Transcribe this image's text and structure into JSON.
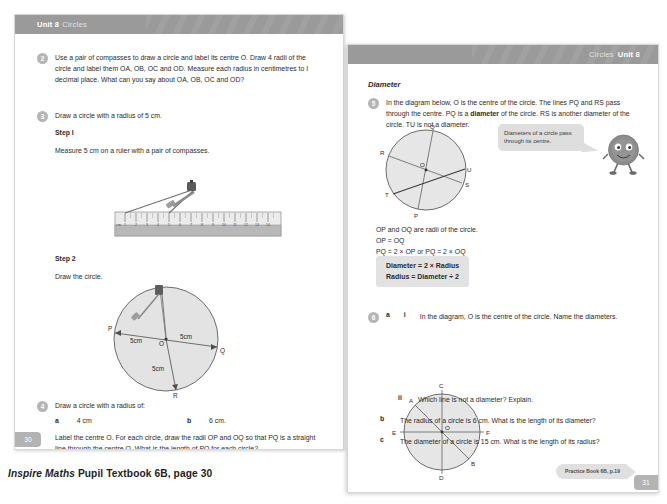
{
  "caption": {
    "italic_part": "Inspire Maths",
    "rest_part": " Pupil Textbook 6B, page 30"
  },
  "left_page": {
    "header": {
      "unit": "Unit 8",
      "topic": "Circles"
    },
    "page_number": "30",
    "questions": [
      {
        "number": "2",
        "text": "Use a pair of compasses to draw a circle and label its centre O. Draw 4 radii of the circle and label them OA, OB, OC and OD. Measure each radius in centimetres to I decimal place. What can you say about OA, OB, OC and OD?"
      },
      {
        "number": "3",
        "text": "Draw a circle with a radius of 5 cm."
      },
      {
        "number": "4",
        "text": "Draw a circle with a radius of:"
      }
    ],
    "step1": {
      "label": "Step I",
      "text": "Measure 5 cm on a ruler with a pair of compasses."
    },
    "step2": {
      "label": "Step 2",
      "text": "Draw the circle."
    },
    "q4_options": {
      "a_letter": "a",
      "a_value": "4 cm",
      "b_letter": "b",
      "b_value": "6 cm."
    },
    "q4_followup": "Label the centre O. For each circle, draw the radii OP and OQ so that PQ is a straight line through the centre O. What is the length of PQ for each circle?",
    "circle_figure": {
      "labels": {
        "p": "P",
        "o": "O",
        "q": "Q",
        "r": "R"
      },
      "dim_left": "5cm",
      "dim_right": "5cm",
      "dim_down": "5cm"
    },
    "ruler_figure": {
      "unit_mark": "cm",
      "ticks": [
        "1",
        "2",
        "3",
        "4",
        "5",
        "6",
        "7",
        "8",
        "9",
        "10",
        "11",
        "12",
        "13",
        "14"
      ]
    }
  },
  "right_page": {
    "header": {
      "unit": "Unit 8",
      "topic": "Circles"
    },
    "page_number": "31",
    "section_title": "Diameter",
    "questions": [
      {
        "number": "5",
        "text_before_bold": "In the diagram below, O is the centre of the circle. The lines PQ and RS pass through the centre. PQ is a ",
        "bold_word": "diameter",
        "text_after_bold": " of the circle. RS is another diameter of the circle. TU is not a diameter."
      },
      {
        "number": "6",
        "a_letter": "a",
        "i_numeral": "i",
        "i_text": "In the diagram, O is the centre of the circle. Name the diameters.",
        "ii_numeral": "ii",
        "ii_text": "Which line is not a diameter? Explain.",
        "b_letter": "b",
        "b_text": "The radius of a circle is 6 cm. What is the length of its diameter?",
        "c_letter": "c",
        "c_text": "The diameter of a circle is 15 cm. What is the length of its radius?"
      }
    ],
    "q5_figure_labels": {
      "q": "Q",
      "r": "R",
      "o": "O",
      "u": "U",
      "s": "S",
      "t": "T",
      "p": "P"
    },
    "q5_notes": [
      "OP and OQ are radii of the circle.",
      "OP = OQ",
      "PQ = 2 × OP or PQ = 2 × OQ"
    ],
    "formula": {
      "line1": "Diameter = 2 × Radius",
      "line2": "Radius = Diameter ÷ 2"
    },
    "speech_bubble": "Diameters of a circle pass through its centre.",
    "q6_figure_labels": {
      "c": "C",
      "a": "A",
      "e": "E",
      "o": "O",
      "f": "F",
      "b": "B",
      "d": "D"
    },
    "practice_tag": "Practice Book 6B, p.19"
  },
  "colors": {
    "band": "#9a9a9a",
    "qnum": "#b5b5b5",
    "figure_fill": "#e6e6e6",
    "bubble": "#dedede",
    "formula_box": "#e2e2e2"
  }
}
